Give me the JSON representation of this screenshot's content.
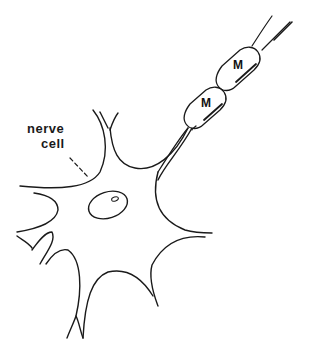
{
  "diagram": {
    "labels": {
      "nerve_cell_line1": "nerve",
      "nerve_cell_line2": "cell",
      "myelin_1": "M",
      "myelin_2": "M"
    },
    "colors": {
      "stroke": "#1a1a1a",
      "background": "#ffffff"
    },
    "elements": [
      "nerve cell body (soma) with branching dendrites",
      "nucleus with nucleolus",
      "axon extending to upper right",
      "two myelin sheath segments labeled M"
    ]
  }
}
